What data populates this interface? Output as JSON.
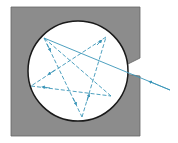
{
  "diagram": {
    "colors": {
      "background": "#ffffff",
      "block_fill": "#8c8c8c",
      "block_stroke": "#555555",
      "cavity_fill": "#ffffff",
      "cavity_stroke": "#1a1a1a",
      "ray": "#3a95b8"
    },
    "block": {
      "x": 11,
      "y": 7,
      "width": 129,
      "height": 129
    },
    "cavity": {
      "cx": 78,
      "cy": 71,
      "r": 50
    },
    "incident_ray": {
      "from": [
        170,
        90
      ],
      "to": [
        44,
        38
      ]
    },
    "reflection_points": [
      [
        44,
        38
      ],
      [
        82,
        117
      ],
      [
        106,
        37
      ],
      [
        31,
        86
      ],
      [
        111,
        96
      ],
      [
        44,
        38
      ]
    ]
  }
}
